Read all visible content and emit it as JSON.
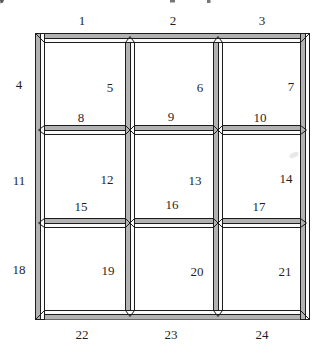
{
  "diagram": {
    "kind": "3x3 beveled window-pane grid with 24 numbered edge segments"
  },
  "labels": [
    "1",
    "2",
    "3",
    "4",
    "5",
    "6",
    "7",
    "8",
    "9",
    "10",
    "11",
    "12",
    "13",
    "14",
    "15",
    "16",
    "17",
    "18",
    "19",
    "20",
    "21",
    "22",
    "23",
    "24"
  ],
  "colors": {
    "outline": "#1c1c1c",
    "bevel_shade": "#b2b2b2",
    "bevel_light": "#fbfbfb",
    "background": "#ffffff",
    "label_text": "#1f1f1f"
  }
}
